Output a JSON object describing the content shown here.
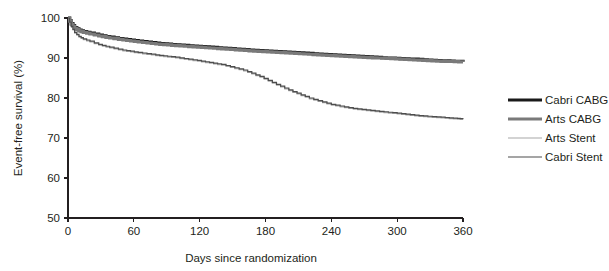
{
  "chart_data": {
    "type": "line",
    "title": "",
    "xlabel": "Days since randomization",
    "ylabel": "Event-free survival (%)",
    "xlim": [
      0,
      360
    ],
    "ylim": [
      50,
      100
    ],
    "xticks": [
      0,
      60,
      120,
      180,
      240,
      300,
      360
    ],
    "yticks": [
      50,
      60,
      70,
      80,
      90,
      100
    ],
    "xtick_labels": [
      "0",
      "60",
      "120",
      "180",
      "240",
      "300",
      "360"
    ],
    "ytick_labels": [
      "50",
      "60",
      "70",
      "80",
      "90",
      "100"
    ],
    "grid": false,
    "legend_position": "right",
    "series": [
      {
        "name": "Cabri CABG",
        "color": "#1a1a1a",
        "width": 3.2,
        "x": [
          0,
          3,
          6,
          10,
          14,
          20,
          28,
          38,
          50,
          64,
          80,
          98,
          118,
          140,
          165,
          190,
          215,
          240,
          265,
          290,
          315,
          340,
          360
        ],
        "y": [
          100,
          98.6,
          97.6,
          97.0,
          96.6,
          96.2,
          95.7,
          95.2,
          94.7,
          94.2,
          93.7,
          93.3,
          92.9,
          92.5,
          92.0,
          91.6,
          91.2,
          90.8,
          90.4,
          90.0,
          89.7,
          89.3,
          89.1
        ]
      },
      {
        "name": "Arts CABG",
        "color": "#7a7a7a",
        "width": 3.2,
        "x": [
          0,
          3,
          6,
          10,
          14,
          20,
          28,
          38,
          50,
          64,
          80,
          98,
          118,
          140,
          165,
          190,
          215,
          240,
          265,
          290,
          315,
          340,
          360
        ],
        "y": [
          100,
          98.4,
          97.4,
          96.8,
          96.4,
          96.0,
          95.5,
          95.0,
          94.5,
          94.0,
          93.5,
          93.1,
          92.7,
          92.3,
          91.8,
          91.4,
          91.0,
          90.6,
          90.2,
          89.9,
          89.5,
          89.2,
          89.0
        ]
      },
      {
        "name": "Arts Stent",
        "color": "#a8a8a8",
        "width": 1.2,
        "x": [
          0,
          3,
          6,
          10,
          14,
          20,
          28,
          38,
          50,
          64,
          80,
          98,
          118,
          140,
          160,
          175,
          190,
          205,
          220,
          240,
          260,
          280,
          300,
          320,
          340,
          355,
          360
        ],
        "y": [
          100,
          97.8,
          96.2,
          95.2,
          94.6,
          94.0,
          93.2,
          92.5,
          91.8,
          91.2,
          90.6,
          90.0,
          89.2,
          88.2,
          86.8,
          85.2,
          83.2,
          81.4,
          79.8,
          78.2,
          77.2,
          76.6,
          76.0,
          75.4,
          75.0,
          74.7,
          74.6
        ]
      },
      {
        "name": "Cabri Stent",
        "color": "#4d4d4d",
        "width": 1.2,
        "x": [
          0,
          3,
          6,
          10,
          14,
          20,
          28,
          38,
          50,
          64,
          80,
          98,
          118,
          140,
          160,
          175,
          190,
          205,
          220,
          240,
          260,
          280,
          300,
          320,
          340,
          355,
          360
        ],
        "y": [
          100,
          97.9,
          96.4,
          95.4,
          94.8,
          94.2,
          93.4,
          92.7,
          92.0,
          91.4,
          90.8,
          90.2,
          89.4,
          88.4,
          87.0,
          85.4,
          83.4,
          81.6,
          80.0,
          78.4,
          77.4,
          76.8,
          76.2,
          75.6,
          75.2,
          74.9,
          74.8
        ]
      }
    ]
  },
  "legend": {
    "entries": [
      {
        "label": "Cabri CABG",
        "color": "#1a1a1a",
        "width": 3.2
      },
      {
        "label": "Arts CABG",
        "color": "#7a7a7a",
        "width": 3.2
      },
      {
        "label": "Arts Stent",
        "color": "#a8a8a8",
        "width": 1.2
      },
      {
        "label": "Cabri Stent",
        "color": "#4d4d4d",
        "width": 1.2
      }
    ]
  },
  "colors": {
    "axis": "#231f20",
    "background": "#ffffff"
  }
}
